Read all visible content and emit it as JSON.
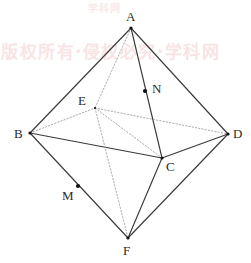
{
  "figure": {
    "type": "geometry-diagram",
    "shape_name": "octahedron",
    "canvas": {
      "width": 251,
      "height": 263
    },
    "stroke_color": "#3a3a3a",
    "hidden_stroke_color": "#9a9a9a",
    "point_color": "#111111",
    "background_color": "#ffffff",
    "vertices": [
      {
        "id": "A",
        "label": "A",
        "x": 131,
        "y": 28,
        "label_x": 126,
        "label_y": 10,
        "kind": "apex-top"
      },
      {
        "id": "B",
        "label": "B",
        "x": 30,
        "y": 133,
        "label_x": 14,
        "label_y": 127,
        "kind": "equator"
      },
      {
        "id": "C",
        "label": "C",
        "x": 162,
        "y": 158,
        "label_x": 166,
        "label_y": 160,
        "kind": "equator"
      },
      {
        "id": "D",
        "label": "D",
        "x": 228,
        "y": 134,
        "label_x": 233,
        "label_y": 127,
        "kind": "equator"
      },
      {
        "id": "E",
        "label": "E",
        "x": 95,
        "y": 108,
        "label_x": 78,
        "label_y": 94,
        "kind": "equator-hidden"
      },
      {
        "id": "F",
        "label": "F",
        "x": 128,
        "y": 238,
        "label_x": 123,
        "label_y": 244,
        "kind": "apex-bottom"
      }
    ],
    "marked_points": [
      {
        "id": "M",
        "label": "M",
        "x": 78,
        "y": 186,
        "label_x": 62,
        "label_y": 189,
        "on_segment": "B-F",
        "radius": 2.1
      },
      {
        "id": "N",
        "label": "N",
        "x": 145,
        "y": 91,
        "label_x": 152,
        "label_y": 82,
        "on_segment": "A-C",
        "radius": 2.1
      }
    ],
    "edges": [
      {
        "from": "A",
        "to": "B",
        "style": "solid",
        "name": "edge-ab"
      },
      {
        "from": "A",
        "to": "D",
        "style": "solid",
        "name": "edge-ad"
      },
      {
        "from": "A",
        "to": "C",
        "style": "solid",
        "name": "edge-ac"
      },
      {
        "from": "A",
        "to": "E",
        "style": "dotted",
        "name": "edge-ae"
      },
      {
        "from": "B",
        "to": "C",
        "style": "solid",
        "name": "edge-bc"
      },
      {
        "from": "C",
        "to": "D",
        "style": "solid",
        "name": "edge-cd"
      },
      {
        "from": "B",
        "to": "E",
        "style": "dotted",
        "name": "edge-be"
      },
      {
        "from": "E",
        "to": "D",
        "style": "dotted",
        "name": "edge-ed"
      },
      {
        "from": "E",
        "to": "C",
        "style": "dotted",
        "name": "edge-ec"
      },
      {
        "from": "E",
        "to": "F",
        "style": "dotted",
        "name": "edge-ef"
      },
      {
        "from": "B",
        "to": "F",
        "style": "solid",
        "name": "edge-bf"
      },
      {
        "from": "C",
        "to": "F",
        "style": "solid",
        "name": "edge-cf"
      },
      {
        "from": "D",
        "to": "F",
        "style": "solid",
        "name": "edge-df"
      }
    ]
  },
  "watermark": {
    "top_text": "学科网",
    "main_text": "版权所有·侵权必究·学科网",
    "color": "#f6dcdc"
  }
}
